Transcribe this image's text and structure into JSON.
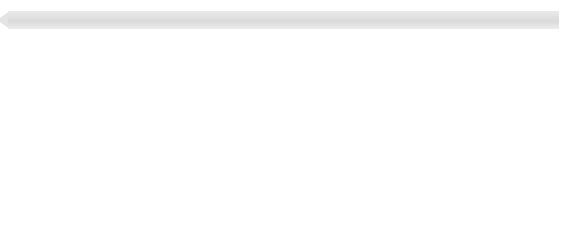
{
  "markers": [
    {
      "label": "Ramascide",
      "year": 2006.0
    },
    {
      "label": "Shadow Life",
      "year": 2009.05
    },
    {
      "label": "Dark Adrenaline",
      "year": 2011.95
    }
  ],
  "axis": {
    "years": [
      "2004",
      "2005",
      "2006",
      "2007",
      "2008",
      "2009",
      "2010",
      "2011",
      "2012"
    ],
    "min": 2003.75,
    "max": 2012.15
  },
  "colors": {
    "title_band": "#dedede",
    "marker_stem": "#c9c9c9",
    "marker_label": "#8f8f8f",
    "year_label": "#c2c2c2",
    "tick": "#dddddd",
    "background": "#ffffff"
  },
  "chart_data": {
    "type": "area",
    "xlabel": "",
    "ylabel": "",
    "xlim": [
      2003.75,
      2012.15
    ],
    "grid": true,
    "legend": "none",
    "orientation": "horizontal-bands",
    "categories": [
      "2004",
      "2005",
      "2006",
      "2007",
      "2008",
      "2009",
      "2010",
      "2011",
      "2012"
    ],
    "series": [
      {
        "name": "band-1",
        "color": "#f2f2f2",
        "thickness": 17,
        "values": [
          17,
          17,
          17,
          17,
          17,
          17,
          17,
          17,
          17
        ]
      },
      {
        "name": "band-2",
        "color": "#ffffff",
        "thickness": 5,
        "values": [
          5,
          5,
          5,
          5,
          5,
          5,
          5,
          5,
          5
        ]
      },
      {
        "name": "band-3",
        "color": "#ededed",
        "thickness": 18,
        "values": [
          18,
          18,
          18,
          18,
          18,
          18,
          18,
          18,
          18
        ]
      },
      {
        "name": "band-4",
        "color": "#ffffff",
        "thickness": 4,
        "values": [
          4,
          4,
          4,
          4,
          4,
          4,
          4,
          4,
          4
        ]
      },
      {
        "name": "band-5",
        "color": "#3f3f3f",
        "thickness": 16,
        "values": [
          16,
          16,
          16,
          16,
          16,
          16,
          16,
          16,
          16
        ]
      },
      {
        "name": "band-6",
        "color": "#ffffff",
        "thickness": 5,
        "values": [
          5,
          5,
          5,
          5,
          5,
          5,
          5,
          5,
          5
        ]
      },
      {
        "name": "band-7",
        "color": "#444444",
        "thickness": 15,
        "values": [
          15,
          15,
          15,
          15,
          15,
          15,
          15,
          15,
          15
        ]
      },
      {
        "name": "band-8",
        "color": "#ffffff",
        "thickness": 6,
        "values": [
          6,
          6,
          6,
          6,
          6,
          6,
          6,
          6,
          6
        ]
      },
      {
        "name": "band-9",
        "color": "#b6b6b6",
        "thickness": 13,
        "values": [
          13,
          13,
          13,
          13,
          13,
          13,
          13,
          13,
          13
        ]
      },
      {
        "name": "band-10",
        "color": "#ffffff",
        "thickness": 3,
        "values": [
          3,
          3,
          3,
          3,
          3,
          3,
          3,
          3,
          3
        ]
      },
      {
        "name": "band-11",
        "color": "#8c8c8c",
        "thickness": 14,
        "values": [
          14,
          14,
          14,
          14,
          14,
          14,
          14,
          14,
          14
        ]
      }
    ],
    "annotations": [
      {
        "label": "Ramascide",
        "x": 2006.0
      },
      {
        "label": "Shadow Life",
        "x": 2009.05
      },
      {
        "label": "Dark Adrenaline",
        "x": 2011.95
      }
    ]
  }
}
